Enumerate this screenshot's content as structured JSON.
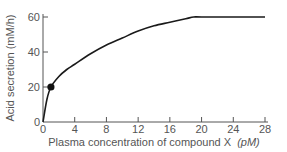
{
  "chart_data": {
    "type": "line",
    "title": "",
    "xlabel": "Plasma concentration of compound X",
    "xlabel_unit": "(pM)",
    "ylabel": "Acid secretion (mM/h)",
    "xlim": [
      0,
      28
    ],
    "ylim": [
      0,
      60
    ],
    "x_ticks": [
      0,
      4,
      8,
      12,
      16,
      20,
      24,
      28
    ],
    "y_ticks": [
      0,
      20,
      40,
      60
    ],
    "grid": false,
    "legend": null,
    "series": [
      {
        "name": "Acid secretion",
        "x": [
          0,
          0.5,
          1,
          2,
          3,
          4,
          6,
          8,
          10,
          12,
          14,
          16,
          18,
          19,
          20,
          24,
          28
        ],
        "values": [
          0,
          13,
          20,
          26,
          30,
          33,
          39,
          44,
          48,
          52,
          55,
          57,
          59,
          60,
          60,
          60,
          60
        ]
      }
    ],
    "annotations": [
      {
        "type": "marker",
        "x": 1,
        "y": 20,
        "shape": "filled-circle"
      }
    ]
  },
  "colors": {
    "line": "#1a1a1a",
    "axis": "#555555",
    "text": "#555555"
  }
}
